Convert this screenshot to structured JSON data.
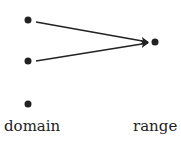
{
  "diagram": {
    "type": "function-mapping",
    "domain": {
      "label": "domain",
      "points": [
        {
          "id": "d1",
          "x": 28,
          "y": 20
        },
        {
          "id": "d2",
          "x": 28,
          "y": 61
        },
        {
          "id": "d3",
          "x": 28,
          "y": 104
        }
      ]
    },
    "range": {
      "label": "range",
      "points": [
        {
          "id": "r1",
          "x": 155,
          "y": 42
        }
      ]
    },
    "arrows": [
      {
        "from": "d1",
        "to": "r1"
      },
      {
        "from": "d2",
        "to": "r1"
      }
    ],
    "colors": {
      "ink": "#222222",
      "background": "#ffffff"
    }
  }
}
